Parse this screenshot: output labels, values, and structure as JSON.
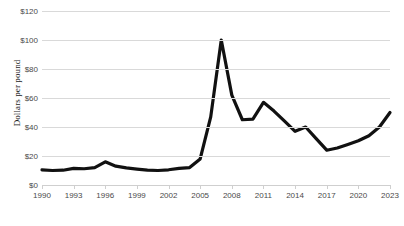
{
  "chart_data": {
    "type": "line",
    "title": "",
    "xlabel": "",
    "ylabel": "Dollars per pound",
    "xlim": [
      1990,
      2023
    ],
    "ylim": [
      0,
      120
    ],
    "grid": true,
    "legend": false,
    "line_color": "#111111",
    "y_ticks": [
      "$0",
      "$20",
      "$40",
      "$60",
      "$80",
      "$100",
      "$120"
    ],
    "y_tick_values": [
      0,
      20,
      40,
      60,
      80,
      100,
      120
    ],
    "x_ticks": [
      "1990",
      "1993",
      "1996",
      "1999",
      "2002",
      "2005",
      "2008",
      "2011",
      "2014",
      "2017",
      "2020",
      "2023"
    ],
    "x_tick_values": [
      1990,
      1993,
      1996,
      1999,
      2002,
      2005,
      2008,
      2011,
      2014,
      2017,
      2020,
      2023
    ],
    "x": [
      1990,
      1991,
      1992,
      1993,
      1994,
      1995,
      1996,
      1997,
      1998,
      1999,
      2000,
      2001,
      2002,
      2003,
      2004,
      2005,
      2006,
      2007,
      2008,
      2009,
      2010,
      2011,
      2012,
      2013,
      2014,
      2015,
      2016,
      2017,
      2018,
      2019,
      2020,
      2021,
      2022,
      2023
    ],
    "values": [
      10.5,
      10.0,
      10.2,
      11.5,
      11.2,
      12.0,
      16.0,
      13.0,
      11.8,
      11.0,
      10.3,
      10.0,
      10.5,
      11.5,
      12.0,
      18.0,
      47.0,
      100.0,
      62.0,
      45.0,
      45.5,
      57.0,
      51.0,
      44.0,
      37.0,
      40.0,
      32.0,
      24.0,
      25.5,
      28.0,
      30.5,
      34.0,
      40.0,
      50.0
    ]
  }
}
